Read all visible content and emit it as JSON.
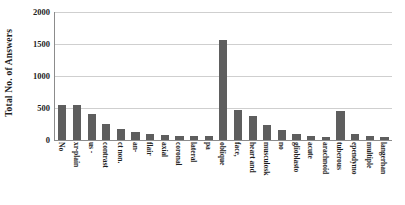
{
  "chart_data": {
    "type": "bar",
    "title": "",
    "xlabel": "",
    "ylabel": "Total No. of Answers",
    "ylim": [
      0,
      2000
    ],
    "yticks": [
      0,
      500,
      1000,
      1500,
      2000
    ],
    "ytick_labels": [
      "0",
      "500",
      "1000",
      "1500",
      "2000"
    ],
    "grid": true,
    "legend": "none",
    "bar_color": "#5e5e5e",
    "categories": [
      "No",
      "xr-plain",
      "us -",
      "contrast",
      "ct non.",
      "an-",
      "flair",
      "axial",
      "coronal",
      "lateral",
      "pa",
      "oblique",
      "face,",
      "heart and",
      "musculosk",
      "no",
      "glioblasto",
      "acute",
      "arachnoid",
      "tuberous",
      "ependymo",
      "multiple",
      "langerhan"
    ],
    "values": [
      540,
      540,
      410,
      250,
      175,
      120,
      95,
      80,
      70,
      65,
      60,
      1570,
      470,
      370,
      230,
      150,
      90,
      55,
      45,
      455,
      95,
      60,
      40
    ],
    "bars": [
      {
        "value": 540
      },
      {
        "value": 540
      },
      {
        "value": 410
      },
      {
        "value": 250
      },
      {
        "value": 175
      },
      {
        "value": 120
      },
      {
        "value": 95
      },
      {
        "value": 80
      },
      {
        "value": 70
      },
      {
        "value": 65
      },
      {
        "value": 60
      },
      {
        "value": 1570
      },
      {
        "value": 470
      },
      {
        "value": 370
      },
      {
        "value": 230
      },
      {
        "value": 150
      },
      {
        "value": 90
      },
      {
        "value": 55
      },
      {
        "value": 45
      },
      {
        "value": 455
      },
      {
        "value": 95
      },
      {
        "value": 60
      },
      {
        "value": 40
      }
    ]
  }
}
